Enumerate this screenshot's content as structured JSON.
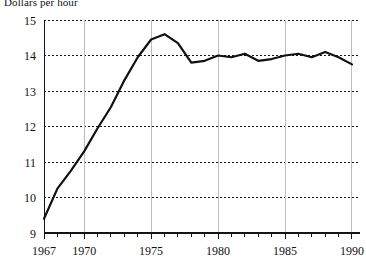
{
  "chart_data": {
    "type": "line",
    "title": "Dollars per hour",
    "xlabel": "",
    "ylabel": "",
    "xlim": [
      1967,
      1990.6
    ],
    "ylim": [
      9,
      15
    ],
    "grid": "horizontal dotted black at each integer y; vertical light gray at labeled years",
    "legend": "none",
    "ytick_labels": [
      "9",
      "10",
      "11",
      "12",
      "13",
      "14",
      "15"
    ],
    "ytick_values": [
      9,
      10,
      11,
      12,
      13,
      14,
      15
    ],
    "xtick_labels": [
      "1967",
      "1970",
      "1975",
      "1980",
      "1985",
      "1990"
    ],
    "xtick_values": [
      1967,
      1970,
      1975,
      1980,
      1985,
      1990
    ],
    "xminor_ticks": [
      1967,
      1968,
      1969,
      1970,
      1971,
      1972,
      1973,
      1974,
      1975,
      1976,
      1977,
      1978,
      1979,
      1980,
      1981,
      1982,
      1983,
      1984,
      1985,
      1986,
      1987,
      1988,
      1989,
      1990
    ],
    "series": [
      {
        "name": "Dollars per hour",
        "color": "#111111",
        "x": [
          1967,
          1968,
          1969,
          1970,
          1971,
          1972,
          1973,
          1974,
          1975,
          1976,
          1977,
          1978,
          1979,
          1980,
          1981,
          1982,
          1983,
          1984,
          1985,
          1986,
          1987,
          1988,
          1989,
          1990
        ],
        "values": [
          9.4,
          10.25,
          10.75,
          11.3,
          11.95,
          12.55,
          13.3,
          13.95,
          14.45,
          14.6,
          14.35,
          13.8,
          13.85,
          14.0,
          13.95,
          14.05,
          13.85,
          13.9,
          14.0,
          14.05,
          13.95,
          14.1,
          13.95,
          13.75
        ]
      }
    ]
  }
}
